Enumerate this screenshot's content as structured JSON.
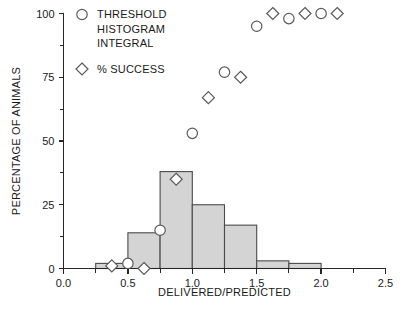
{
  "chart_data": {
    "type": "bar",
    "title": "",
    "subtitle": "",
    "xlabel": "DELIVERED/PREDICTED",
    "ylabel": "PERCENTAGE OF ANIMALS",
    "xlim": [
      0.0,
      2.5
    ],
    "ylim": [
      0,
      100
    ],
    "grid": false,
    "legend_position": "top-left",
    "x_ticks": [
      {
        "value": 0.0,
        "label": "0.0"
      },
      {
        "value": 0.5,
        "label": "0.5"
      },
      {
        "value": 1.0,
        "label": "1.0"
      },
      {
        "value": 1.5,
        "label": "1.5"
      },
      {
        "value": 2.0,
        "label": "2.0"
      },
      {
        "value": 2.5,
        "label": "2.5"
      }
    ],
    "x_minor_ticks": [
      0.25,
      0.75,
      1.25,
      1.75,
      2.25
    ],
    "y_ticks": [
      {
        "value": 0,
        "label": "0"
      },
      {
        "value": 25,
        "label": "25"
      },
      {
        "value": 50,
        "label": "50"
      },
      {
        "value": 75,
        "label": "75"
      },
      {
        "value": 100,
        "label": "100"
      }
    ],
    "y_minor_ticks": [
      12.5,
      37.5,
      62.5,
      87.5
    ],
    "legend": [
      {
        "marker": "circle",
        "label_lines": [
          "THRESHOLD",
          "HISTOGRAM",
          "INTEGRAL"
        ]
      },
      {
        "marker": "diamond",
        "label_lines": [
          "% SUCCESS"
        ]
      }
    ],
    "series": [
      {
        "name": "histogram",
        "type": "bar",
        "bin_width": 0.25,
        "bins": [
          {
            "x_start": 0.25,
            "x_end": 0.5,
            "value": 2
          },
          {
            "x_start": 0.5,
            "x_end": 0.75,
            "value": 14
          },
          {
            "x_start": 0.75,
            "x_end": 1.0,
            "value": 38
          },
          {
            "x_start": 1.0,
            "x_end": 1.25,
            "value": 25
          },
          {
            "x_start": 1.25,
            "x_end": 1.5,
            "value": 17
          },
          {
            "x_start": 1.5,
            "x_end": 1.75,
            "value": 3
          },
          {
            "x_start": 1.75,
            "x_end": 2.0,
            "value": 2
          }
        ]
      },
      {
        "name": "THRESHOLD HISTOGRAM INTEGRAL",
        "type": "scatter",
        "marker": "circle",
        "points": [
          {
            "x": 0.5,
            "y": 2
          },
          {
            "x": 0.75,
            "y": 15
          },
          {
            "x": 1.0,
            "y": 53
          },
          {
            "x": 1.25,
            "y": 77
          },
          {
            "x": 1.5,
            "y": 95
          },
          {
            "x": 1.75,
            "y": 98
          },
          {
            "x": 2.0,
            "y": 100
          }
        ]
      },
      {
        "name": "% SUCCESS",
        "type": "scatter",
        "marker": "diamond",
        "points": [
          {
            "x": 0.375,
            "y": 1
          },
          {
            "x": 0.625,
            "y": 0
          },
          {
            "x": 0.875,
            "y": 35
          },
          {
            "x": 1.125,
            "y": 67
          },
          {
            "x": 1.375,
            "y": 75
          },
          {
            "x": 1.625,
            "y": 100
          },
          {
            "x": 1.875,
            "y": 100
          },
          {
            "x": 2.125,
            "y": 100
          }
        ]
      }
    ],
    "colors": {
      "bar_fill": "#d4d4d4",
      "bar_stroke": "#4a4a4a",
      "marker_stroke": "#5a5a5a",
      "marker_fill": "#ffffff",
      "axis": "#262626",
      "text": "#1a1a1a",
      "background": "#ffffff"
    }
  }
}
